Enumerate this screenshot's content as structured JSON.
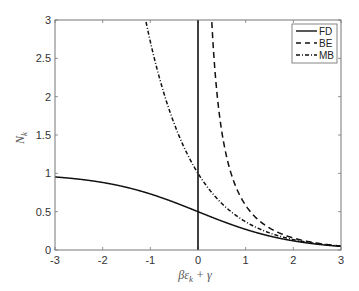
{
  "chart_data": {
    "type": "line",
    "title": "",
    "xlabel": "βε_k + γ",
    "ylabel": "N_k",
    "xlim": [
      -3,
      3
    ],
    "ylim": [
      0,
      3
    ],
    "xticks": [
      "-3",
      "-2",
      "-1",
      "0",
      "1",
      "2",
      "3"
    ],
    "yticks": [
      "0",
      "0.5",
      "1",
      "1.5",
      "2",
      "2.5",
      "3"
    ],
    "grid": false,
    "legend_position": "upper right",
    "vertical_reference_line_x": 0,
    "x": [
      -3,
      -2.5,
      -2,
      -1.5,
      -1,
      -0.5,
      0,
      0.5,
      1,
      1.5,
      2,
      2.5,
      3
    ],
    "series": [
      {
        "name": "FD",
        "style": "solid",
        "formula": "1/(exp(x)+1)",
        "values": [
          0.953,
          0.924,
          0.881,
          0.818,
          0.731,
          0.622,
          0.5,
          0.378,
          0.269,
          0.182,
          0.119,
          0.076,
          0.047
        ]
      },
      {
        "name": "BE",
        "style": "dashed",
        "formula": "1/(exp(x)-1)",
        "values": [
          null,
          null,
          null,
          null,
          null,
          null,
          null,
          1.541,
          0.582,
          0.287,
          0.157,
          0.089,
          0.052
        ]
      },
      {
        "name": "MB",
        "style": "dash-dot",
        "formula": "exp(-x)",
        "values": [
          null,
          null,
          null,
          null,
          2.718,
          1.649,
          1.0,
          0.607,
          0.368,
          0.223,
          0.135,
          0.082,
          0.05
        ]
      }
    ]
  },
  "legend": {
    "items": [
      {
        "label": "FD"
      },
      {
        "label": "BE"
      },
      {
        "label": "MB"
      }
    ]
  },
  "axes": {
    "xlabel_beta": "βε",
    "xlabel_sub": "k",
    "xlabel_rest": " + γ",
    "ylabel_main": "N",
    "ylabel_sub": "k"
  }
}
